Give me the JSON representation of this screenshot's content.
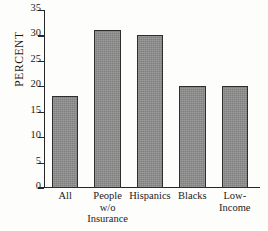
{
  "chart_data": {
    "type": "bar",
    "title": "",
    "xlabel": "",
    "ylabel": "PERCENT",
    "categories": [
      "All",
      "People w/o Insurance",
      "Hispanics",
      "Blacks",
      "Low-Income"
    ],
    "category_lines": [
      [
        "All"
      ],
      [
        "People",
        "w/o",
        "Insurance"
      ],
      [
        "Hispanics"
      ],
      [
        "Blacks"
      ],
      [
        "Low-",
        "Income"
      ]
    ],
    "values": [
      18,
      31,
      30,
      20,
      20
    ],
    "ylim": [
      0,
      35
    ],
    "yticks": [
      0,
      5,
      10,
      15,
      20,
      25,
      30,
      35
    ],
    "ytick_labels": [
      "0",
      "5",
      "10",
      "15",
      "20",
      "25",
      "30",
      "35"
    ],
    "grid": false,
    "legend": false,
    "bar_color": "#8d8d8d",
    "bar_edge_color": "#2e2e2e",
    "axis_color": "#272727",
    "background": "#fdfdfc"
  }
}
